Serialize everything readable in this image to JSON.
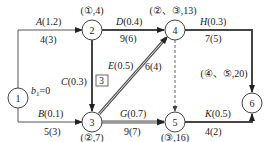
{
  "diagram": {
    "type": "activity-on-arrow network",
    "nodes": [
      {
        "id": "1",
        "label": "1",
        "annotation": "b1=0"
      },
      {
        "id": "2",
        "label": "2",
        "annotation": "(①,4)"
      },
      {
        "id": "3",
        "label": "3",
        "annotation": "(②,7)"
      },
      {
        "id": "4",
        "label": "4",
        "annotation": "(②、③,13)"
      },
      {
        "id": "5",
        "label": "5",
        "annotation": "(③,16)"
      },
      {
        "id": "6",
        "label": "6",
        "annotation": "(④、⑤,20)"
      }
    ],
    "edges": [
      {
        "from": "1",
        "to": "2",
        "name": "A",
        "prob": "(1.2)",
        "duration": "4(3)",
        "critical": false
      },
      {
        "from": "1",
        "to": "3",
        "name": "B",
        "prob": "(0.1)",
        "duration": "5(3)",
        "critical": false
      },
      {
        "from": "2",
        "to": "3",
        "name": "C",
        "prob": "(0.3)",
        "duration": "3",
        "critical": true
      },
      {
        "from": "2",
        "to": "4",
        "name": "D",
        "prob": "(0.4)",
        "duration": "9(6)",
        "critical": true
      },
      {
        "from": "3",
        "to": "4",
        "name": "E",
        "prob": "(0.5)",
        "duration": "6(4)",
        "critical": true
      },
      {
        "from": "3",
        "to": "5",
        "name": "G",
        "prob": "(0.7)",
        "duration": "9(7)",
        "critical": true
      },
      {
        "from": "4",
        "to": "5",
        "name": "",
        "prob": "",
        "duration": "",
        "dummy": true
      },
      {
        "from": "4",
        "to": "6",
        "name": "H",
        "prob": "(0.3)",
        "duration": "7(5)",
        "critical": true
      },
      {
        "from": "5",
        "to": "6",
        "name": "K",
        "prob": "(0.5)",
        "duration": "4(2)",
        "critical": true
      }
    ],
    "start_annotation": {
      "var": "b",
      "sub": "1",
      "value": "=0"
    }
  }
}
